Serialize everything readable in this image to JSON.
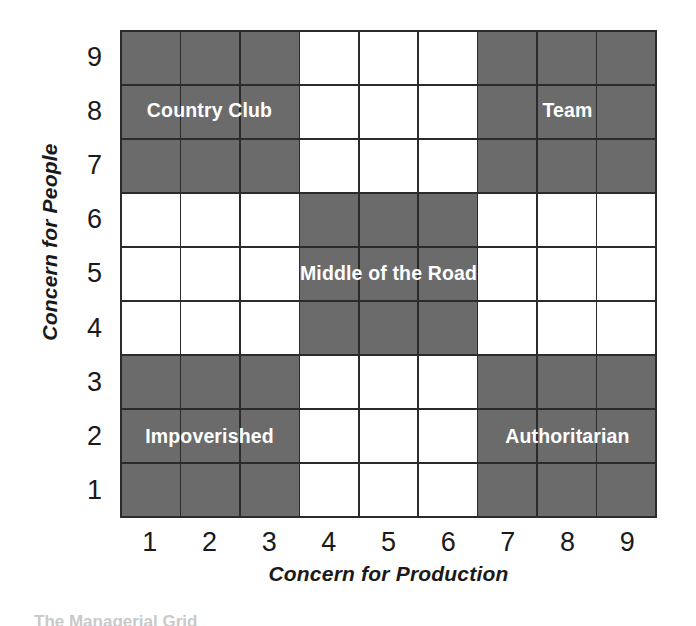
{
  "figure": {
    "x_axis": {
      "title": "Concern for Production",
      "ticks": [
        "1",
        "2",
        "3",
        "4",
        "5",
        "6",
        "7",
        "8",
        "9"
      ]
    },
    "y_axis": {
      "title": "Concern for People",
      "ticks": [
        "9",
        "8",
        "7",
        "6",
        "5",
        "4",
        "3",
        "2",
        "1"
      ]
    },
    "caption_clipped": "The Managerial Grid",
    "colors": {
      "shaded_cell": "#6b6b6b",
      "empty_cell": "#ffffff",
      "grid_line": "#2b2b2b",
      "label_text": "#ffffff",
      "axis_text": "#1a1a1a"
    },
    "regions": [
      {
        "name": "Country Club",
        "label": "Country Club",
        "col_start": 1,
        "col_end": 3,
        "row_start": 7,
        "row_end": 9,
        "shaded": true
      },
      {
        "name": "Team",
        "label": "Team",
        "col_start": 7,
        "col_end": 9,
        "row_start": 7,
        "row_end": 9,
        "shaded": true
      },
      {
        "name": "Middle of the Road",
        "label": "Middle of the Road",
        "col_start": 4,
        "col_end": 6,
        "row_start": 4,
        "row_end": 6,
        "shaded": true
      },
      {
        "name": "Impoverished",
        "label": "Impoverished",
        "col_start": 1,
        "col_end": 3,
        "row_start": 1,
        "row_end": 3,
        "shaded": true
      },
      {
        "name": "Authoritarian",
        "label": "Authoritarian",
        "col_start": 7,
        "col_end": 9,
        "row_start": 1,
        "row_end": 3,
        "shaded": true
      }
    ]
  },
  "chart_data": {
    "type": "heatmap",
    "title": "",
    "xlabel": "Concern for Production",
    "ylabel": "Concern for People",
    "xlim": [
      1,
      9
    ],
    "ylim": [
      1,
      9
    ],
    "x_tick_labels": [
      "1",
      "2",
      "3",
      "4",
      "5",
      "6",
      "7",
      "8",
      "9"
    ],
    "y_tick_labels": [
      "9",
      "8",
      "7",
      "6",
      "5",
      "4",
      "3",
      "2",
      "1"
    ],
    "grid": true,
    "legend": "none",
    "cell_states": [
      [
        1,
        1,
        1,
        0,
        0,
        0,
        1,
        1,
        1
      ],
      [
        1,
        1,
        1,
        0,
        0,
        0,
        1,
        1,
        1
      ],
      [
        1,
        1,
        1,
        0,
        0,
        0,
        1,
        1,
        1
      ],
      [
        0,
        0,
        0,
        1,
        1,
        1,
        0,
        0,
        0
      ],
      [
        0,
        0,
        0,
        1,
        1,
        1,
        0,
        0,
        0
      ],
      [
        0,
        0,
        0,
        1,
        1,
        1,
        0,
        0,
        0
      ],
      [
        1,
        1,
        1,
        0,
        0,
        0,
        1,
        1,
        1
      ],
      [
        1,
        1,
        1,
        0,
        0,
        0,
        1,
        1,
        1
      ],
      [
        1,
        1,
        1,
        0,
        0,
        0,
        1,
        1,
        1
      ]
    ],
    "cell_state_meaning": {
      "1": "shaded",
      "0": "empty"
    },
    "row_order": "top row is Concern for People = 9, bottom row is 1",
    "annotations": [
      {
        "text": "Country Club",
        "x": 2,
        "y": 8,
        "style": "1,9 style"
      },
      {
        "text": "Team",
        "x": 8,
        "y": 8,
        "style": "9,9 style"
      },
      {
        "text": "Middle of the Road",
        "x": 5,
        "y": 5,
        "style": "5,5 style"
      },
      {
        "text": "Impoverished",
        "x": 2,
        "y": 2,
        "style": "1,1 style"
      },
      {
        "text": "Authoritarian",
        "x": 8,
        "y": 2,
        "style": "9,1 style"
      }
    ]
  }
}
